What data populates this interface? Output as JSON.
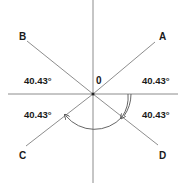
{
  "diagram": {
    "type": "intersecting-lines-angles",
    "center_label": "0",
    "points": [
      {
        "id": "A",
        "label": "A"
      },
      {
        "id": "B",
        "label": "B"
      },
      {
        "id": "C",
        "label": "C"
      },
      {
        "id": "D",
        "label": "D"
      }
    ],
    "angles": [
      {
        "region": "upper-right",
        "label": "40.43°"
      },
      {
        "region": "upper-left",
        "label": "40.43°"
      },
      {
        "region": "lower-left",
        "label": "40.43°"
      },
      {
        "region": "lower-right",
        "label": "40.43°"
      }
    ],
    "colors": {
      "line": "#808080",
      "text": "#1a1a1a",
      "background": "#ffffff"
    }
  }
}
